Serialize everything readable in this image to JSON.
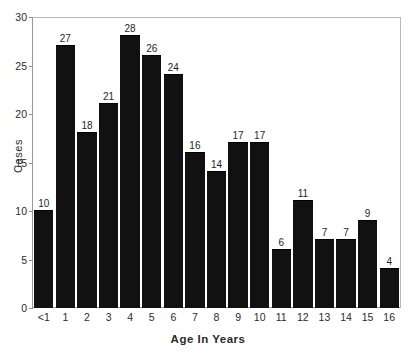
{
  "chart_data": {
    "type": "bar",
    "title": "",
    "xlabel": "Age In Years",
    "ylabel": "Cases",
    "categories": [
      "<1",
      "1",
      "2",
      "3",
      "4",
      "5",
      "6",
      "7",
      "8",
      "9",
      "10",
      "11",
      "12",
      "13",
      "14",
      "15",
      "16"
    ],
    "values": [
      10,
      27,
      18,
      21,
      28,
      26,
      24,
      16,
      14,
      17,
      17,
      6,
      11,
      7,
      7,
      9,
      4
    ],
    "value_labels": [
      "10",
      "27",
      "18",
      "21",
      "28",
      "26",
      "24",
      "16",
      "14",
      "17",
      "17",
      "6",
      "11",
      "7",
      "7",
      "9",
      "4"
    ],
    "ylim": [
      0,
      30
    ],
    "yticks": [
      0,
      5,
      10,
      15,
      20,
      25,
      30
    ],
    "ytick_labels": [
      "0",
      "5",
      "10",
      "15",
      "20",
      "25",
      "30"
    ],
    "grid": false,
    "legend": null,
    "bar_color": "#111111",
    "axis_color": "#9a9a9a",
    "text_color": "#2b2b2b",
    "background": "#ffffff",
    "data_labels_shown": true
  }
}
